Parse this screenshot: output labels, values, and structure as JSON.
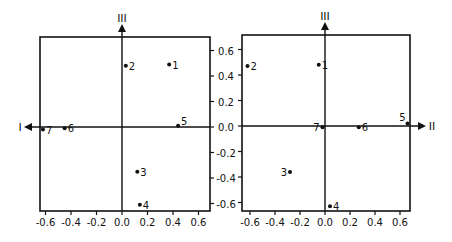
{
  "chart_data": [
    {
      "type": "scatter",
      "title": "",
      "xlabel": "I",
      "ylabel": "III",
      "xlim": [
        -0.65,
        0.7
      ],
      "ylim": [
        -0.7,
        0.7
      ],
      "x_ticks": [
        "-0.6",
        "-0.4",
        "-0.2",
        "0.0",
        "0.2",
        "0.4",
        "0.6"
      ],
      "y_ticks": [
        "0.6",
        "0.4",
        "0.2",
        "0.0",
        "-0.2",
        "-0.4",
        "-0.6"
      ],
      "grid": false,
      "points": [
        {
          "label": "1",
          "x": 0.37,
          "y": 0.49
        },
        {
          "label": "2",
          "x": 0.03,
          "y": 0.48
        },
        {
          "label": "3",
          "x": 0.12,
          "y": -0.35
        },
        {
          "label": "4",
          "x": 0.14,
          "y": -0.61
        },
        {
          "label": "5",
          "x": 0.44,
          "y": 0.01
        },
        {
          "label": "6",
          "x": -0.45,
          "y": -0.01
        },
        {
          "label": "7",
          "x": -0.62,
          "y": -0.02
        }
      ]
    },
    {
      "type": "scatter",
      "title": "",
      "xlabel": "II",
      "ylabel": "III",
      "xlim": [
        -0.65,
        0.7
      ],
      "ylim": [
        -0.7,
        0.7
      ],
      "x_ticks": [
        "-0.6",
        "-0.4",
        "-0.2",
        "0.0",
        "0.2",
        "0.4",
        "0.6"
      ],
      "y_ticks": [
        "0.6",
        "0.4",
        "0.2",
        "0.0",
        "-0.2",
        "-0.4",
        "-0.6"
      ],
      "grid": false,
      "points": [
        {
          "label": "1",
          "x": -0.05,
          "y": 0.48
        },
        {
          "label": "2",
          "x": -0.62,
          "y": 0.47
        },
        {
          "label": "3",
          "x": -0.28,
          "y": -0.36
        },
        {
          "label": "4",
          "x": 0.04,
          "y": -0.63
        },
        {
          "label": "5",
          "x": 0.66,
          "y": 0.02
        },
        {
          "label": "6",
          "x": 0.27,
          "y": -0.01
        },
        {
          "label": "7",
          "x": -0.02,
          "y": -0.01
        }
      ]
    }
  ],
  "labels": {
    "left_x_axis": "I",
    "right_x_axis": "II",
    "y_axis_left": "III",
    "y_axis_right": "III"
  }
}
